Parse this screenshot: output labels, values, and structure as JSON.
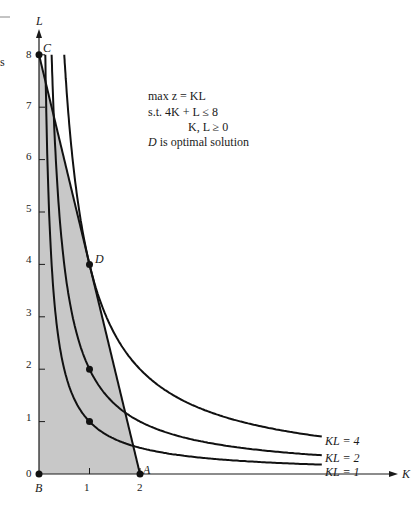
{
  "chart_data": {
    "type": "line",
    "title": "",
    "xlabel": "K",
    "ylabel": "L",
    "xlim": [
      0,
      7.3
    ],
    "ylim": [
      0,
      8.5
    ],
    "x_ticks": [
      "1",
      "2"
    ],
    "y_ticks": [
      "0",
      "1",
      "2",
      "3",
      "4",
      "5",
      "6",
      "7",
      "8"
    ],
    "grid": false,
    "annotation": {
      "line1": "max z = KL",
      "line2": "s.t.   4K + L ≤ 8",
      "line3": "K, L ≥ 0",
      "line4_italic": "D",
      "line4_rest": " is optimal solution"
    },
    "feasible_region": {
      "polygon": [
        [
          0,
          0
        ],
        [
          2,
          0
        ],
        [
          0,
          8
        ]
      ],
      "fill": "#c8c8c8"
    },
    "constraint_line": {
      "name": "4K + L = 8",
      "points": [
        [
          0,
          8
        ],
        [
          2,
          0
        ]
      ]
    },
    "series": [
      {
        "name": "KL = 1",
        "equation": "L = 1/K",
        "k_range": [
          0.125,
          5.6
        ]
      },
      {
        "name": "KL = 2",
        "equation": "L = 2/K",
        "k_range": [
          0.25,
          5.6
        ]
      },
      {
        "name": "KL = 4",
        "equation": "L = 4/K",
        "k_range": [
          0.5,
          5.6
        ]
      }
    ],
    "points": [
      {
        "label": "A",
        "x": 2,
        "y": 0
      },
      {
        "label": "B",
        "x": 0,
        "y": 0
      },
      {
        "label": "C",
        "x": 0,
        "y": 8
      },
      {
        "label": "D",
        "x": 1,
        "y": 4
      },
      {
        "label": "",
        "x": 1,
        "y": 2
      },
      {
        "label": "",
        "x": 1,
        "y": 1
      }
    ],
    "legend": {
      "position": "inline-right",
      "entries": [
        "KL = 4",
        "KL = 2",
        "KL = 1"
      ]
    }
  }
}
